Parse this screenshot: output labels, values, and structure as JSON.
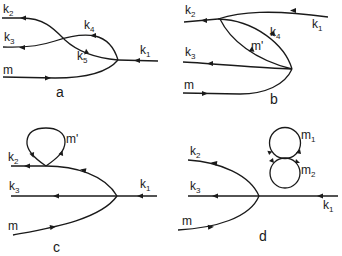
{
  "figure": {
    "panels": [
      {
        "id": "a",
        "label": "a",
        "lines": [
          {
            "name": "k",
            "sub": "2"
          },
          {
            "name": "k",
            "sub": "3"
          },
          {
            "name": "k",
            "sub": "4"
          },
          {
            "name": "k",
            "sub": "5"
          },
          {
            "name": "k",
            "sub": "1"
          },
          {
            "name": "m",
            "sub": ""
          }
        ]
      },
      {
        "id": "b",
        "label": "b",
        "lines": [
          {
            "name": "k",
            "sub": "2"
          },
          {
            "name": "k",
            "sub": "1"
          },
          {
            "name": "k",
            "sub": "4"
          },
          {
            "name": "m'",
            "sub": ""
          },
          {
            "name": "k",
            "sub": "3"
          },
          {
            "name": "m",
            "sub": ""
          }
        ]
      },
      {
        "id": "c",
        "label": "c",
        "lines": [
          {
            "name": "m'",
            "sub": ""
          },
          {
            "name": "k",
            "sub": "2"
          },
          {
            "name": "k",
            "sub": "3"
          },
          {
            "name": "k",
            "sub": "1"
          },
          {
            "name": "m",
            "sub": ""
          }
        ]
      },
      {
        "id": "d",
        "label": "d",
        "lines": [
          {
            "name": "m",
            "sub": "1"
          },
          {
            "name": "m",
            "sub": "2"
          },
          {
            "name": "k",
            "sub": "2"
          },
          {
            "name": "k",
            "sub": "3"
          },
          {
            "name": "k",
            "sub": "1"
          },
          {
            "name": "m",
            "sub": ""
          }
        ]
      }
    ]
  }
}
